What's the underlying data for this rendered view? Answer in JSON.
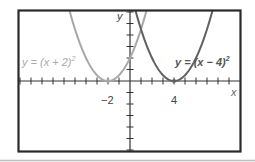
{
  "chart_data": {
    "type": "line",
    "title": "",
    "xlabel": "x",
    "ylabel": "y",
    "grid": false,
    "xlim": [
      -10.2,
      10.1
    ],
    "ylim": [
      -12.4,
      12.3
    ],
    "x_tick_labels": [
      {
        "value": -2,
        "label": "-2"
      },
      {
        "value": 4,
        "label": "4"
      }
    ],
    "series": [
      {
        "name": "y = (x + 2)^2",
        "label": "y = (x + 2)²",
        "color": "#a8a8a8",
        "vertex": [
          -2,
          0
        ],
        "x": [
          -5.5,
          -5,
          -4,
          -3,
          -2,
          -1,
          0,
          1,
          1.5
        ],
        "values": [
          12.25,
          9,
          4,
          1,
          0,
          1,
          4,
          9,
          12.25
        ]
      },
      {
        "name": "y = (x - 4)^2",
        "label": "y = (x − 4)²",
        "color": "#606060",
        "vertex": [
          4,
          0
        ],
        "x": [
          0.5,
          1,
          2,
          3,
          4,
          5,
          6,
          7,
          7.5
        ],
        "values": [
          12.25,
          9,
          4,
          1,
          0,
          1,
          4,
          9,
          12.25
        ]
      }
    ]
  },
  "labels": {
    "x_axis": "x",
    "y_axis": "y",
    "tick_neg2": "−2",
    "tick_4": "4",
    "left_eq_prefix": "y = (x + 2)",
    "right_eq_prefix": "y = (x − 4)",
    "exp": "2"
  },
  "colors": {
    "frame": "#2a2a2a",
    "axis": "#333333",
    "left_curve": "#a8a8a8",
    "right_curve": "#606060",
    "bottom_rule": "#bdbdbd"
  }
}
